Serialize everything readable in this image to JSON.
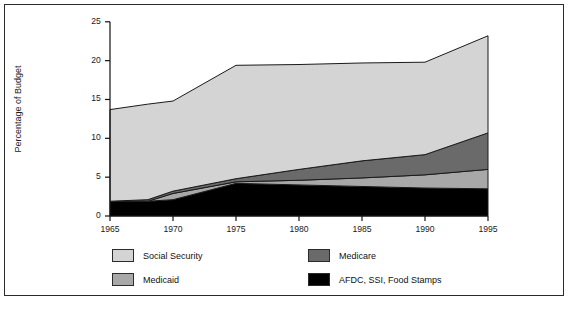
{
  "chart_data": {
    "type": "area",
    "stacked": true,
    "title": "",
    "xlabel": "",
    "ylabel": "Percentage of Budget",
    "x": [
      1965,
      1968,
      1970,
      1975,
      1980,
      1985,
      1990,
      1995
    ],
    "xlim": [
      1965,
      1995
    ],
    "ylim": [
      0,
      25
    ],
    "xticks": [
      1965,
      1970,
      1975,
      1980,
      1985,
      1990,
      1995
    ],
    "yticks": [
      0,
      5,
      10,
      15,
      20,
      25
    ],
    "grid": false,
    "legend_position": "bottom",
    "series": [
      {
        "name": "AFDC, SSI, Food Stamps",
        "color": "#000000",
        "values": [
          1.9,
          1.9,
          2.1,
          4.2,
          4.0,
          3.8,
          3.6,
          3.5
        ]
      },
      {
        "name": "Medicaid",
        "color": "#a8a8a8",
        "values": [
          0.0,
          0.0,
          0.8,
          0.2,
          0.6,
          1.1,
          1.7,
          2.5
        ]
      },
      {
        "name": "Medicare",
        "color": "#6a6a6a",
        "values": [
          0.0,
          0.2,
          0.3,
          0.4,
          1.4,
          2.2,
          2.6,
          4.7
        ]
      },
      {
        "name": "Social Security",
        "color": "#d4d4d4",
        "values": [
          11.8,
          12.3,
          11.6,
          14.6,
          13.5,
          12.6,
          11.9,
          12.5
        ]
      }
    ],
    "cumulative_totals": [
      13.7,
      14.4,
      14.8,
      19.4,
      19.5,
      19.7,
      19.8,
      23.2
    ]
  },
  "legend": {
    "entries": [
      {
        "label": "Social Security",
        "color": "#d4d4d4"
      },
      {
        "label": "Medicaid",
        "color": "#a8a8a8"
      },
      {
        "label": "Medicare",
        "color": "#6a6a6a"
      },
      {
        "label": "AFDC, SSI, Food Stamps",
        "color": "#000000"
      }
    ]
  },
  "caption": ""
}
